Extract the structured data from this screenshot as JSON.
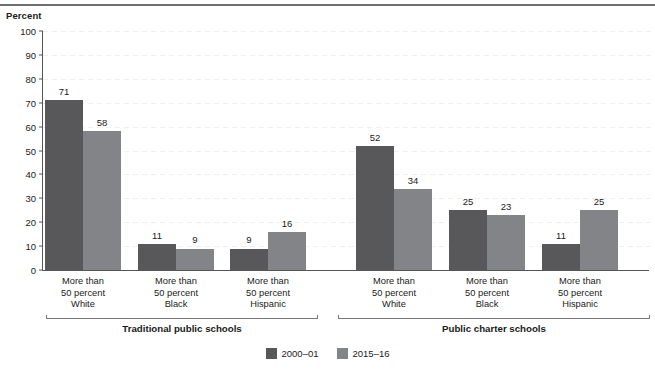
{
  "figure": {
    "axis_title": "Percent"
  },
  "chart_data": {
    "type": "bar",
    "title": "",
    "subtitle": "",
    "xlabel": "",
    "ylabel": "Percent",
    "ylim": [
      0,
      100
    ],
    "ytick_step": 10,
    "grid": true,
    "legend_position": "bottom-center",
    "yticks": [
      "100",
      "90",
      "80",
      "70",
      "60",
      "50",
      "40",
      "30",
      "20",
      "10",
      "0"
    ],
    "categories": [
      "More than 50 percent White",
      "More than 50 percent Black",
      "More than 50 percent Hispanic",
      "More than 50 percent White",
      "More than 50 percent Black",
      "More than 50 percent Hispanic"
    ],
    "category_lines": [
      [
        "More than",
        "50 percent",
        "White"
      ],
      [
        "More than",
        "50 percent",
        "Black"
      ],
      [
        "More than",
        "50 percent",
        "Hispanic"
      ],
      [
        "More than",
        "50 percent",
        "White"
      ],
      [
        "More than",
        "50 percent",
        "Black"
      ],
      [
        "More than",
        "50 percent",
        "Hispanic"
      ]
    ],
    "groups": [
      {
        "label": "Traditional public schools",
        "category_indices": [
          0,
          1,
          2
        ]
      },
      {
        "label": "Public charter schools",
        "category_indices": [
          3,
          4,
          5
        ]
      }
    ],
    "series": [
      {
        "name": "2000-01",
        "color": "#58585a",
        "values": [
          71,
          11,
          9,
          52,
          25,
          11
        ]
      },
      {
        "name": "2015-16",
        "color": "#838487",
        "values": [
          58,
          9,
          16,
          34,
          23,
          25
        ]
      }
    ]
  },
  "legend": {
    "items": [
      {
        "label": "2000–01",
        "swatch": "dark"
      },
      {
        "label": "2015–16",
        "swatch": "light"
      }
    ]
  }
}
